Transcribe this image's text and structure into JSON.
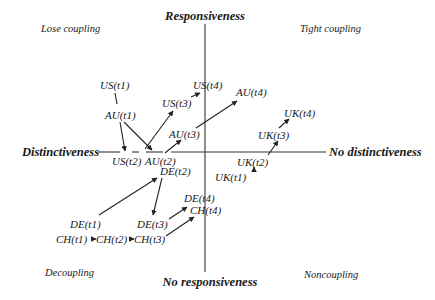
{
  "axes": {
    "top": "Responsiveness",
    "bottom": "No responsiveness",
    "left": "Distinctiveness",
    "right": "No distinctiveness"
  },
  "quadrants": {
    "top_left": "Lose coupling",
    "top_right": "Tight coupling",
    "bottom_left": "Decoupling",
    "bottom_right": "Noncoupling"
  },
  "nodes": {
    "us_t1": "US(t1)",
    "us_t2": "US(t2)",
    "us_t3": "US(t3)",
    "us_t4": "US(t4)",
    "au_t1": "AU(t1)",
    "au_t2": "AU(t2)",
    "au_t3": "AU(t3)",
    "au_t4": "AU(t4)",
    "uk_t1": "UK(t1)",
    "uk_t2": "UK(t2)",
    "uk_t3": "UK(t3)",
    "uk_t4": "UK(t4)",
    "de_t1": "DE(t1)",
    "de_t2": "DE(t2)",
    "de_t3": "DE(t3)",
    "de_t4": "DE(t4)",
    "ch_t1": "CH(t1)",
    "ch_t2": "CH(t2)",
    "ch_t3": "CH(t3)",
    "ch_t4": "CH(t4)"
  },
  "colors": {
    "ink": "#1a1a1a",
    "background": "#ffffff"
  }
}
